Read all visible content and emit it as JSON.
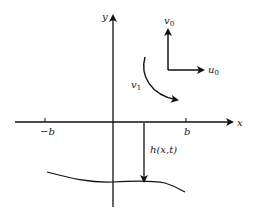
{
  "diagram": {
    "axes": {
      "x_label": "x",
      "y_label": "y",
      "ticks": [
        {
          "label": "−b",
          "position": "negative"
        },
        {
          "label": "b",
          "position": "positive"
        }
      ]
    },
    "velocity_labels": {
      "v0": {
        "base": "v",
        "sub": "0"
      },
      "u0": {
        "base": "u",
        "sub": "0"
      },
      "v1": {
        "base": "v",
        "sub": "1"
      }
    },
    "depth_label": "h(x,t)"
  }
}
